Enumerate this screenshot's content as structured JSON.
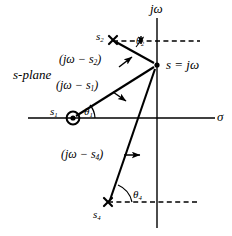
{
  "figure": {
    "plane_label": "s-plane",
    "axes": {
      "vertical_label": "jω",
      "horizontal_label": "σ",
      "origin": {
        "x": 157,
        "y": 118
      },
      "vertical_axis": {
        "x": 157,
        "y_top": 18,
        "y_bottom": 228
      },
      "horizontal_axis": {
        "y": 118,
        "x_left": 28,
        "x_right": 215
      }
    },
    "evaluation_point": {
      "name": "s",
      "label": "s = jω",
      "x": 157,
      "y": 65
    },
    "singularities": [
      {
        "name": "s1",
        "label": "s",
        "subscript": "1",
        "marker": "circled-dot",
        "marker_type": "zero",
        "x": 73,
        "y": 118
      },
      {
        "name": "s2",
        "label": "s",
        "subscript": "2",
        "marker": "cross",
        "marker_type": "pole",
        "x": 113,
        "y": 40
      },
      {
        "name": "s4",
        "label": "s",
        "subscript": "4",
        "marker": "cross",
        "marker_type": "pole",
        "x": 108,
        "y": 202
      }
    ],
    "vectors": [
      {
        "name": "vector-jw-minus-s1",
        "label": "(jω − s",
        "subscript": "1",
        "label_close": ")",
        "from": "s1",
        "to": "s"
      },
      {
        "name": "vector-jw-minus-s2",
        "label": "(jω − s",
        "subscript": "2",
        "label_close": ")",
        "from": "s2",
        "to": "s"
      },
      {
        "name": "vector-jw-minus-s4",
        "label": "(jω − s",
        "subscript": "4",
        "label_close": ")",
        "from": "s4",
        "to": "s"
      }
    ],
    "angles": [
      {
        "name": "theta1",
        "label": "θ",
        "subscript": "1",
        "at": "s1"
      },
      {
        "name": "theta2",
        "label": "θ",
        "subscript": "2",
        "at": "s2"
      },
      {
        "name": "theta4",
        "label": "θ",
        "subscript": "4",
        "at": "s4"
      }
    ],
    "colors": {
      "ink": "#000000",
      "background": "#ffffff"
    }
  }
}
